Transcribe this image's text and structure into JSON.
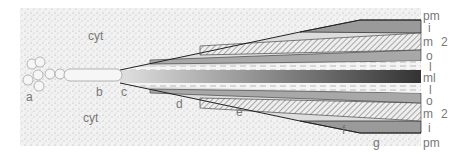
{
  "diagram": {
    "region_labels": {
      "cyt_top": "cyt",
      "cyt_bottom": "cyt"
    },
    "stage_labels": [
      "a",
      "b",
      "c",
      "d",
      "e",
      "f",
      "g"
    ],
    "layer_labels": {
      "pm_top": "pm",
      "i_top": "i",
      "m_top": "m",
      "o_top": "o",
      "l_top": "l",
      "ml": "ml",
      "l_bottom": "l",
      "o_bottom": "o",
      "m_bottom": "m",
      "i_bottom": "i",
      "pm_bottom": "pm",
      "bracket_top": "2",
      "bracket_bottom": "2"
    }
  }
}
